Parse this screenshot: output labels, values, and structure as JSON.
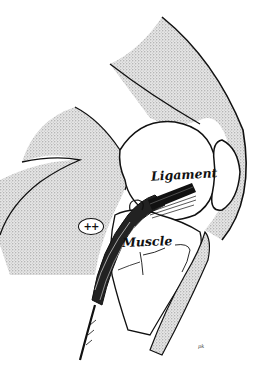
{
  "figure": {
    "labels": {
      "ligament": "Ligament",
      "muscle": "Muscle",
      "plus_marker": "++",
      "artist_signature": "pk"
    },
    "colors": {
      "background": "#ffffff",
      "ink": "#111111",
      "stipple": "#9a9a9a"
    }
  }
}
